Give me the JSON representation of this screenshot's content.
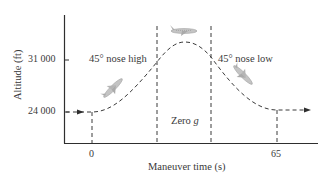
{
  "diagram": {
    "title": "",
    "y_axis": {
      "label": "Altitude (ft)",
      "ticks": [
        "31 000",
        "24 000"
      ]
    },
    "x_axis": {
      "label": "Maneuver time (s)",
      "ticks": [
        "0",
        "65"
      ]
    },
    "annotations": {
      "nose_high": "45° nose high",
      "nose_low": "45° nose low",
      "zero_g_prefix": "Zero ",
      "zero_g_var": "g"
    },
    "icons": [
      "airplane-climbing-icon",
      "airplane-level-icon",
      "airplane-diving-icon"
    ],
    "colors": {
      "line": "#3a3a3a",
      "airplane": "#b8b8b8"
    }
  }
}
